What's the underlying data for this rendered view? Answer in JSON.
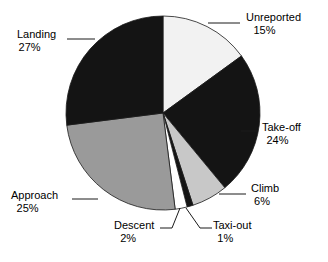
{
  "chart_data": {
    "type": "pie",
    "title": "",
    "subtitle": "",
    "xlabel": "",
    "ylabel": "",
    "legend_position": "none",
    "grid": false,
    "label_format": "name + percent",
    "start_angle_deg": 0,
    "direction": "clockwise",
    "categories": [
      "Unreported",
      "Take-off",
      "Climb",
      "Taxi-out",
      "Descent",
      "Approach",
      "Landing"
    ],
    "values": [
      15,
      24,
      6,
      1,
      2,
      25,
      27
    ],
    "units": "%",
    "slices": [
      {
        "label": "Unreported",
        "percent": 15,
        "percent_text": "15%",
        "color": "#f2f2f2"
      },
      {
        "label": "Take-off",
        "percent": 24,
        "percent_text": "24%",
        "color": "#141414"
      },
      {
        "label": "Climb",
        "percent": 6,
        "percent_text": "6%",
        "color": "#c8c8c8"
      },
      {
        "label": "Taxi-out",
        "percent": 1,
        "percent_text": "1%",
        "color": "#141414"
      },
      {
        "label": "Descent",
        "percent": 2,
        "percent_text": "2%",
        "color": "#ffffff"
      },
      {
        "label": "Approach",
        "percent": 25,
        "percent_text": "25%",
        "color": "#9a9a9a"
      },
      {
        "label": "Landing",
        "percent": 27,
        "percent_text": "27%",
        "color": "#141414"
      }
    ]
  },
  "colors": {
    "background": "#ffffff",
    "outline": "#1a1a1a",
    "text": "#000000",
    "leader": "#1a1a1a"
  }
}
